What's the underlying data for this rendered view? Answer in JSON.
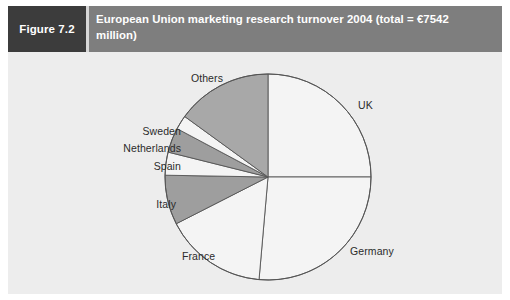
{
  "figure": {
    "number_label": "Figure 7.2",
    "caption": "European Union marketing research turnover 2004 (total = €7542 million)"
  },
  "chart_data": {
    "type": "pie",
    "title": "European Union marketing research turnover 2004 (total = €7542 million)",
    "total": 7542,
    "total_currency": "€",
    "total_units": "million",
    "year": 2004,
    "legend": "none",
    "labels_position": "outside",
    "start_angle_deg": 0,
    "direction": "clockwise",
    "categories": [
      "UK",
      "Germany",
      "France",
      "Italy",
      "Spain",
      "Netherlands",
      "Sweden",
      "Others"
    ],
    "values": [
      25.0,
      26.4,
      16.1,
      7.8,
      3.6,
      3.9,
      2.2,
      15.0
    ],
    "value_units": "percent",
    "angles_deg": [
      90,
      95,
      58,
      28,
      13,
      14,
      8,
      54
    ],
    "slice_colors": [
      "#f4f4f4",
      "#f4f4f4",
      "#f4f4f4",
      "#9e9e9e",
      "#f4f4f4",
      "#9e9e9e",
      "#f4f4f4",
      "#a8a8a8"
    ],
    "slices": [
      {
        "label": "UK",
        "value": 25.0,
        "angle_deg": 90,
        "color": "#f4f4f4"
      },
      {
        "label": "Germany",
        "value": 26.4,
        "angle_deg": 95,
        "color": "#f4f4f4"
      },
      {
        "label": "France",
        "value": 16.1,
        "angle_deg": 58,
        "color": "#f4f4f4"
      },
      {
        "label": "Italy",
        "value": 7.8,
        "angle_deg": 28,
        "color": "#9e9e9e"
      },
      {
        "label": "Spain",
        "value": 3.6,
        "angle_deg": 13,
        "color": "#f4f4f4"
      },
      {
        "label": "Netherlands",
        "value": 3.9,
        "angle_deg": 14,
        "color": "#9e9e9e"
      },
      {
        "label": "Sweden",
        "value": 2.2,
        "angle_deg": 8,
        "color": "#f4f4f4"
      },
      {
        "label": "Others",
        "value": 15.0,
        "angle_deg": 54,
        "color": "#a8a8a8"
      }
    ]
  },
  "colors": {
    "panel_background": "#ededed",
    "caption_bar": "#7e7e7e",
    "figure_number_box": "#3c3c3c",
    "caption_text": "#ffffff",
    "slice_light": "#f4f4f4",
    "slice_dark": "#9e9e9e",
    "slice_others": "#a8a8a8",
    "slice_outline": "#555555",
    "label_text": "#2b2b2b"
  }
}
